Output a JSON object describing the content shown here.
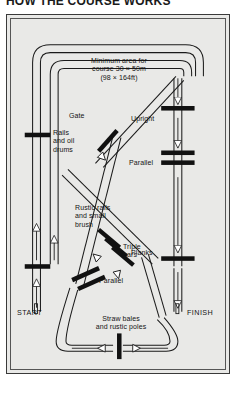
{
  "title": "HOW THE COURSE WORKS",
  "diagram": {
    "center_note": "Minimum area for\ncourse 30 × 50m\n(98 × 164ft)",
    "start_label": "START",
    "finish_label": "FINISH",
    "obstacles": [
      {
        "id": "rails-and-oil-drums",
        "label": "Rails\nand oil\ndrums",
        "type": "single-bar"
      },
      {
        "id": "rustic-rails-and-small-brush",
        "label": "Rustic rails\nand small\nbrush",
        "type": "single-bar"
      },
      {
        "id": "gate",
        "label": "Gate",
        "type": "diagonal-bar"
      },
      {
        "id": "upright",
        "label": "Upright",
        "type": "single-bar"
      },
      {
        "id": "parallel-right",
        "label": "Parallel",
        "type": "double-bar"
      },
      {
        "id": "planks",
        "label": "Planks",
        "type": "single-bar"
      },
      {
        "id": "triple-bars",
        "label": "Triple\nbars",
        "type": "triple-diagonal-bar"
      },
      {
        "id": "parallel-lower",
        "label": "Parallel",
        "type": "double-diagonal-bar"
      },
      {
        "id": "straw-bales-and-rustic-poles",
        "label": "Straw bales\nand rustic poles",
        "type": "vertical-bar"
      }
    ],
    "colors": {
      "plate_background": "#e9e9e7",
      "ink": "#141414",
      "obstacle": "#111111",
      "frame": "#3a3a3a"
    }
  }
}
